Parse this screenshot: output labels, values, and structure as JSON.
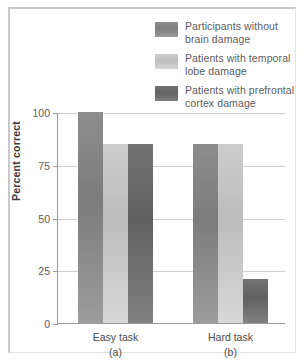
{
  "chart_data": {
    "type": "bar",
    "title": "",
    "xlabel": "",
    "ylabel": "Percent correct",
    "ylim": [
      0,
      100
    ],
    "yticks": [
      0,
      25,
      50,
      75,
      100
    ],
    "ytick_labels": [
      "0",
      "25",
      "50",
      "75",
      "100"
    ],
    "grid": true,
    "legend_position": "top-right",
    "categories": [
      "Easy task",
      "Hard task"
    ],
    "category_sublabels": [
      "(a)",
      "(b)"
    ],
    "series": [
      {
        "name": "Participants without brain damage",
        "name_line1": "Participants without",
        "name_line2": "brain damage",
        "color": "#8d8d8d",
        "values": [
          100,
          85
        ]
      },
      {
        "name": "Patients with temporal lobe damage",
        "name_line1": "Patients with temporal",
        "name_line2": "lobe damage",
        "color": "#cdcdcd",
        "values": [
          85,
          85
        ]
      },
      {
        "name": "Patients with prefrontal cortex damage",
        "name_line1": "Patients with prefrontal",
        "name_line2": "cortex damage",
        "color": "#727272",
        "values": [
          85,
          21
        ]
      }
    ]
  }
}
